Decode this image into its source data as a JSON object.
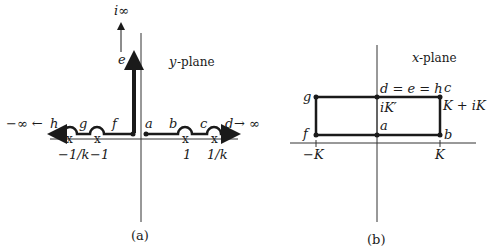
{
  "panel_a": {
    "title": "y-plane",
    "title_var": "y",
    "title_rest": "-plane",
    "caption": "(a)",
    "top_label": "i∞",
    "arrow_label": "e",
    "left_infinity": "−∞ ←",
    "right_infinity": "→ ∞",
    "points": {
      "a": "a",
      "b": "b",
      "c": "c",
      "d": "d",
      "f": "f",
      "g": "g",
      "h": "h"
    },
    "ticks": [
      "−1/k",
      "−1",
      "1",
      "1/k"
    ]
  },
  "panel_b": {
    "title": "x-plane",
    "title_var": "x",
    "title_rest": "-plane",
    "caption": "(b)",
    "top_label": "d = e = h",
    "corner_c": "c",
    "corner_c_value": "K + iK",
    "ik_prime": "iK′",
    "points": {
      "a": "a",
      "b": "b",
      "f": "f",
      "g": "g"
    },
    "ticks": [
      "−K",
      "K"
    ]
  },
  "colors": {
    "ink": "#1a1a1a",
    "axis": "#333333"
  }
}
